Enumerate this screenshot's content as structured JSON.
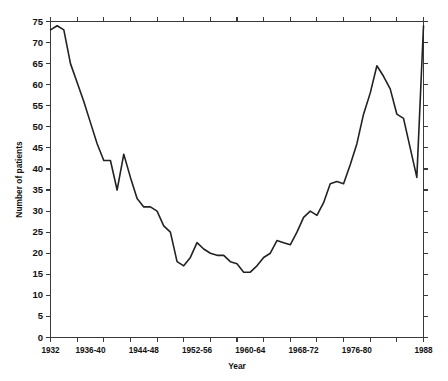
{
  "chart_data": {
    "type": "line",
    "title": "",
    "xlabel": "Year",
    "ylabel": "Number of patients",
    "grid": false,
    "legend": null,
    "ylim": [
      0,
      75
    ],
    "ytick_step": 5,
    "yticks": [
      0,
      5,
      10,
      15,
      20,
      25,
      30,
      35,
      40,
      45,
      50,
      55,
      60,
      65,
      70,
      75
    ],
    "ytick_labels": [
      "0",
      "5",
      "10",
      "15",
      "20",
      "25",
      "30",
      "35",
      "40",
      "45",
      "50",
      "55",
      "60",
      "65",
      "70",
      "75"
    ],
    "xtick_labels": [
      "1932",
      "1936-40",
      "1944-48",
      "1952-56",
      "1960-64",
      "1968-72",
      "1976-80",
      "1988"
    ],
    "xtick_label_positions": [
      1932,
      1938,
      1946,
      1954,
      1962,
      1970,
      1978,
      1988
    ],
    "xlim": [
      1932,
      1988
    ],
    "x": [
      1932,
      1933,
      1934,
      1935,
      1936,
      1937,
      1938,
      1939,
      1940,
      1941,
      1942,
      1943,
      1944,
      1945,
      1946,
      1947,
      1948,
      1949,
      1950,
      1951,
      1952,
      1953,
      1954,
      1955,
      1956,
      1957,
      1958,
      1959,
      1960,
      1961,
      1962,
      1963,
      1964,
      1965,
      1966,
      1967,
      1968,
      1969,
      1970,
      1971,
      1972,
      1973,
      1974,
      1975,
      1976,
      1977,
      1978,
      1979,
      1980,
      1981,
      1982,
      1983,
      1984,
      1985,
      1986,
      1987,
      1988
    ],
    "values": [
      73,
      74,
      73,
      65,
      60.5,
      56,
      51,
      46,
      42,
      42,
      35,
      43.5,
      38,
      33,
      31,
      31,
      30,
      26.5,
      25,
      18,
      17,
      19,
      22.5,
      21,
      20,
      19.5,
      19.5,
      18,
      17.5,
      15.5,
      15.5,
      17,
      19,
      20,
      23,
      22.5,
      22,
      25,
      28.5,
      30,
      29,
      32,
      36.5,
      37,
      36.5,
      41,
      46,
      53,
      58,
      64.5,
      62,
      59,
      53,
      52,
      45,
      38,
      74
    ],
    "series": [
      {
        "name": "Number of patients",
        "values": [
          73,
          74,
          73,
          65,
          60.5,
          56,
          51,
          46,
          42,
          42,
          35,
          43.5,
          38,
          33,
          31,
          31,
          30,
          26.5,
          25,
          18,
          17,
          19,
          22.5,
          21,
          20,
          19.5,
          19.5,
          18,
          17.5,
          15.5,
          15.5,
          17,
          19,
          20,
          23,
          22.5,
          22,
          25,
          28.5,
          30,
          29,
          32,
          36.5,
          37,
          36.5,
          41,
          46,
          53,
          58,
          64.5,
          62,
          59,
          53,
          52,
          45,
          38,
          74
        ],
        "color": "#222222"
      }
    ],
    "annotations": []
  },
  "axes": {
    "x_title": "Year",
    "y_title": "Number of patients"
  },
  "colors": {
    "line": "#222222",
    "axis": "#3a3a3a",
    "background": "#ffffff",
    "text": "#111111"
  }
}
